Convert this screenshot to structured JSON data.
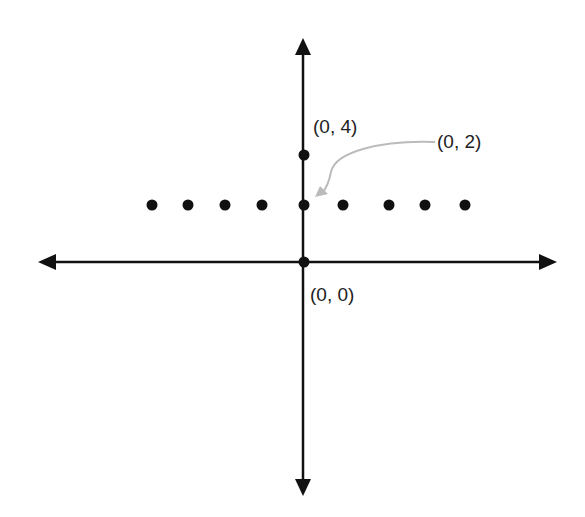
{
  "diagram": {
    "type": "coordinate-plane",
    "labels": {
      "p04": "(0, 4)",
      "p02": "(0, 2)",
      "p00": "(0, 0)"
    },
    "points": [
      {
        "name": "(0, 4)",
        "x": 0,
        "y": 4
      },
      {
        "name": "(0, 2)",
        "x": 0,
        "y": 2
      },
      {
        "name": "(0, 0)",
        "x": 0,
        "y": 0
      }
    ],
    "row_dots_count": 9,
    "colors": {
      "axis": "#111111",
      "dot": "#111111",
      "annotation_arrow": "#bbbbbb"
    }
  }
}
